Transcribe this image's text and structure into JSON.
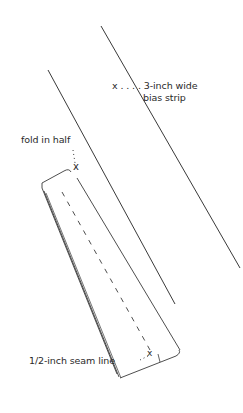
{
  "diagram": {
    "type": "sewing-instruction-illustration",
    "labels": {
      "bias_strip_line1": "x . . . . 3-inch wide",
      "bias_strip_line2": "bias strip",
      "fold": "fold in half",
      "seam": "1/2-inch seam line"
    },
    "markers": {
      "x_glyph": "x"
    },
    "elements": [
      {
        "name": "bias-strip-right-edge",
        "from": [
          101,
          26
        ],
        "to": [
          240,
          268
        ]
      },
      {
        "name": "bias-strip-left-edge",
        "from": [
          48,
          70
        ],
        "to": [
          175,
          304
        ]
      },
      {
        "name": "folded-strip",
        "description": "strip folded in half lengthwise"
      },
      {
        "name": "seam-line",
        "style": "dashed",
        "from": [
          62,
          192
        ],
        "to": [
          150,
          350
        ]
      }
    ],
    "colors": {
      "line": "#3a3a3a",
      "text": "#2a2a2a",
      "background": "#ffffff"
    }
  }
}
